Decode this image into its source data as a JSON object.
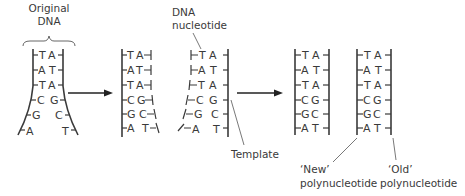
{
  "diagram": {
    "colors": {
      "ink": "#3a3a3a",
      "arrow": "#222222",
      "background": "#ffffff"
    },
    "labels": {
      "original_dna_line1": "Original",
      "original_dna_line2": "DNA",
      "dna_nucleotide_line1": "DNA",
      "dna_nucleotide_line2": "nucleotide",
      "template": "Template",
      "new_poly_line1": "‘New’",
      "new_poly_line2": "polynucleotide",
      "old_poly_line1": "‘Old’",
      "old_poly_line2": "polynucleotide"
    },
    "stages": [
      {
        "name": "original",
        "pairs": [
          {
            "left": "T",
            "right": "A"
          },
          {
            "left": "A",
            "right": "T"
          },
          {
            "left": "T",
            "right": "A"
          },
          {
            "left": "C",
            "right": "G"
          },
          {
            "left": "G",
            "right": "C"
          },
          {
            "left": "A",
            "right": "T"
          }
        ]
      },
      {
        "name": "unzipping",
        "left_strand_pairs": [
          {
            "left": "T",
            "right": "A"
          },
          {
            "left": "A",
            "right": "T"
          },
          {
            "left": "T",
            "right": "A"
          },
          {
            "left": "C",
            "right": "G"
          },
          {
            "left": "G",
            "right": "C"
          },
          {
            "left": "A",
            "right": "T"
          }
        ],
        "right_strand_pairs": [
          {
            "left": "T",
            "right": "A"
          },
          {
            "left": "A",
            "right": "T"
          },
          {
            "left": "T",
            "right": "A"
          },
          {
            "left": "C",
            "right": "G"
          },
          {
            "left": "G",
            "right": "C"
          },
          {
            "left": "A",
            "right": "T"
          }
        ]
      },
      {
        "name": "replicated",
        "molecule_1": [
          {
            "left": "T",
            "right": "A"
          },
          {
            "left": "A",
            "right": "T"
          },
          {
            "left": "T",
            "right": "A"
          },
          {
            "left": "C",
            "right": "G"
          },
          {
            "left": "G",
            "right": "C"
          },
          {
            "left": "A",
            "right": "T"
          }
        ],
        "molecule_2": [
          {
            "left": "T",
            "right": "A"
          },
          {
            "left": "A",
            "right": "T"
          },
          {
            "left": "T",
            "right": "A"
          },
          {
            "left": "C",
            "right": "G"
          },
          {
            "left": "G",
            "right": "C"
          },
          {
            "left": "A",
            "right": "T"
          }
        ]
      }
    ]
  }
}
